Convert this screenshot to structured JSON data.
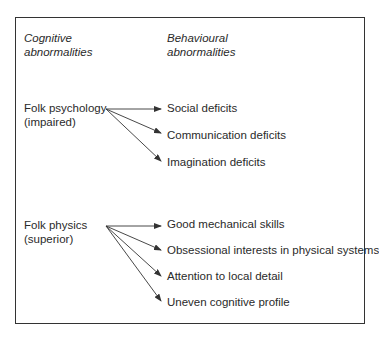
{
  "diagram": {
    "headings": {
      "cognitive_line1": "Cognitive",
      "cognitive_line2": "abnormalities",
      "behavioural_line1": "Behavioural",
      "behavioural_line2": "abnormalities"
    },
    "groups": [
      {
        "source_line1": "Folk psychology",
        "source_line2": "(impaired)",
        "targets": [
          "Social deficits",
          "Communication deficits",
          "Imagination deficits"
        ]
      },
      {
        "source_line1": "Folk physics",
        "source_line2": "(superior)",
        "targets": [
          "Good mechanical skills",
          "Obsessional interests in physical systems",
          "Attention to local detail",
          "Uneven cognitive profile"
        ]
      }
    ],
    "colors": {
      "line": "#333333",
      "text": "#2a2a2a"
    }
  }
}
